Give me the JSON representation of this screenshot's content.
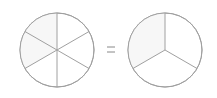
{
  "diagram": {
    "left_circle": {
      "parts": 6,
      "label": "sixths"
    },
    "operator": "=",
    "right_circle": {
      "parts": 3,
      "label": "thirds"
    },
    "colors": {
      "stroke": "#a0a0a0",
      "fill": "#ffffff",
      "shade": "#f7f7f7"
    }
  }
}
